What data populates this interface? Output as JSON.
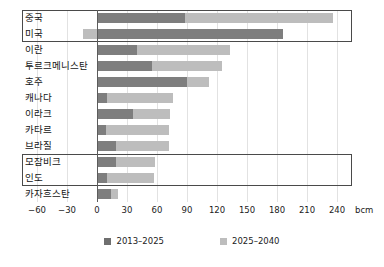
{
  "chart_data": {
    "type": "bar",
    "orientation": "horizontal",
    "stacked": true,
    "title": "",
    "xlabel": "bcm",
    "ylabel": "",
    "xlim": [
      -75,
      255
    ],
    "xticks": [
      -60,
      -30,
      0,
      30,
      60,
      90,
      120,
      150,
      180,
      210,
      240
    ],
    "xtick_labels": [
      "−60",
      "−30",
      "0",
      "30",
      "60",
      "90",
      "120",
      "150",
      "180",
      "210",
      "240"
    ],
    "unit_label": "bcm",
    "grid": true,
    "legend_position": "bottom",
    "categories": [
      "중국",
      "미국",
      "이란",
      "투르크메니스탄",
      "호주",
      "캐나다",
      "이라크",
      "카타르",
      "브라질",
      "모잠비크",
      "인도",
      "카자흐스탄"
    ],
    "series": [
      {
        "name": "2013–2025",
        "color": "#7e7e7e",
        "values": [
          88,
          186,
          40,
          55,
          90,
          10,
          36,
          9,
          19,
          19,
          10,
          14
        ]
      },
      {
        "name": "2025–2040",
        "color": "#bdbdbd",
        "values": [
          148,
          -14,
          93,
          70,
          22,
          66,
          37,
          63,
          53,
          39,
          47,
          7
        ]
      }
    ],
    "totals": [
      236,
      172,
      133,
      125,
      112,
      76,
      73,
      72,
      72,
      58,
      57,
      21
    ],
    "highlights": [
      {
        "label": "중국-미국 강조 박스",
        "from_index": 0,
        "to_index": 1
      },
      {
        "label": "모잠비크-인도 강조 박스",
        "from_index": 9,
        "to_index": 10
      }
    ]
  },
  "legend": {
    "items": [
      {
        "label": "2013–2025",
        "swatch": "dark-swatch"
      },
      {
        "label": "2025–2040",
        "swatch": "light-swatch"
      }
    ]
  },
  "colors": {
    "series_dark": "#7e7e7e",
    "series_light": "#bdbdbd",
    "gridline": "#e2e2e2",
    "zeroline": "#5c5c5c",
    "highlight_border": "#4a4a4a",
    "text": "#1b1b1b",
    "background": "#ffffff"
  }
}
